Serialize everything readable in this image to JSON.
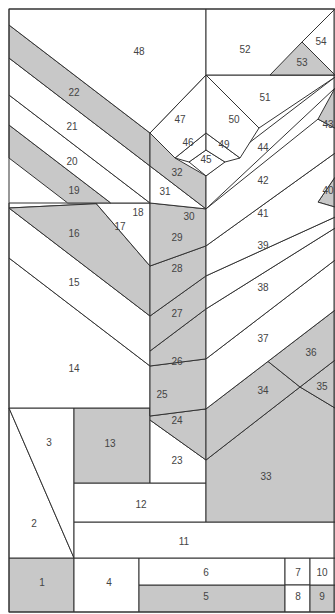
{
  "colors": {
    "shaded": "#c8c8c8",
    "plain": "#ffffff",
    "line": "#333333",
    "label": "#444444"
  },
  "pieces": [
    {
      "id": "1",
      "shaded": true
    },
    {
      "id": "2",
      "shaded": false
    },
    {
      "id": "3",
      "shaded": false
    },
    {
      "id": "4",
      "shaded": false
    },
    {
      "id": "5",
      "shaded": true
    },
    {
      "id": "6",
      "shaded": false
    },
    {
      "id": "7",
      "shaded": false
    },
    {
      "id": "8",
      "shaded": false
    },
    {
      "id": "9",
      "shaded": true
    },
    {
      "id": "10",
      "shaded": false
    },
    {
      "id": "11",
      "shaded": false
    },
    {
      "id": "12",
      "shaded": false
    },
    {
      "id": "13",
      "shaded": true
    },
    {
      "id": "14",
      "shaded": false
    },
    {
      "id": "15",
      "shaded": false
    },
    {
      "id": "16",
      "shaded": false
    },
    {
      "id": "17",
      "shaded": true
    },
    {
      "id": "18",
      "shaded": false
    },
    {
      "id": "19",
      "shaded": true
    },
    {
      "id": "20",
      "shaded": false
    },
    {
      "id": "21",
      "shaded": false
    },
    {
      "id": "22",
      "shaded": true
    },
    {
      "id": "23",
      "shaded": false
    },
    {
      "id": "24",
      "shaded": true
    },
    {
      "id": "25",
      "shaded": false
    },
    {
      "id": "26",
      "shaded": true
    },
    {
      "id": "27",
      "shaded": true
    },
    {
      "id": "28",
      "shaded": true
    },
    {
      "id": "29",
      "shaded": true
    },
    {
      "id": "30",
      "shaded": true
    },
    {
      "id": "31",
      "shaded": false
    },
    {
      "id": "32",
      "shaded": true
    },
    {
      "id": "33",
      "shaded": true
    },
    {
      "id": "34",
      "shaded": true
    },
    {
      "id": "35",
      "shaded": true
    },
    {
      "id": "36",
      "shaded": true
    },
    {
      "id": "37",
      "shaded": false
    },
    {
      "id": "38",
      "shaded": false
    },
    {
      "id": "39",
      "shaded": false
    },
    {
      "id": "40",
      "shaded": true
    },
    {
      "id": "41",
      "shaded": false
    },
    {
      "id": "42",
      "shaded": false
    },
    {
      "id": "43",
      "shaded": true
    },
    {
      "id": "44",
      "shaded": false
    },
    {
      "id": "45",
      "shaded": false
    },
    {
      "id": "46",
      "shaded": false
    },
    {
      "id": "47",
      "shaded": false
    },
    {
      "id": "48",
      "shaded": false
    },
    {
      "id": "49",
      "shaded": false
    },
    {
      "id": "50",
      "shaded": false
    },
    {
      "id": "51",
      "shaded": false
    },
    {
      "id": "52",
      "shaded": false
    },
    {
      "id": "53",
      "shaded": true
    },
    {
      "id": "54",
      "shaded": false
    }
  ]
}
